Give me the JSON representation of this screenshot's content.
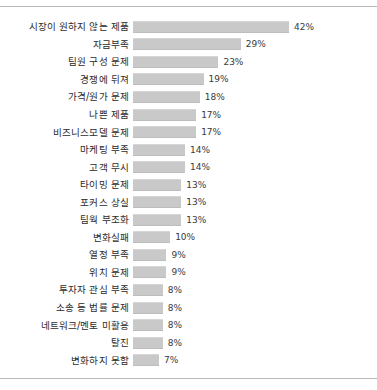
{
  "chart_data": {
    "type": "bar",
    "orientation": "horizontal",
    "title": "",
    "subtitle": "",
    "xlabel": "",
    "ylabel": "",
    "xlim": [
      0,
      42
    ],
    "grid": false,
    "legend": null,
    "value_suffix": "%",
    "bar_color": "#c9c9c9",
    "categories": [
      "시장이 원하지 않는 제품",
      "자금부족",
      "팀원 구성 문제",
      "경쟁에 뒤져",
      "가격/원가 문제",
      "나쁜 제품",
      "비즈니스모델 문제",
      "마케팅 부족",
      "고객 무시",
      "타이밍 문제",
      "포커스 상실",
      "팀웍 부조화",
      "변화실패",
      "열정 부족",
      "위치 문제",
      "투자자 관심 부족",
      "소송 등 법률 문제",
      "네트워크/멘토 미활용",
      "탈진",
      "변화하지 못함"
    ],
    "values": [
      42,
      29,
      23,
      19,
      18,
      17,
      17,
      14,
      14,
      13,
      13,
      13,
      10,
      9,
      9,
      8,
      8,
      8,
      8,
      7
    ],
    "value_labels": [
      "42%",
      "29%",
      "23%",
      "19%",
      "18%",
      "17%",
      "17%",
      "14%",
      "14%",
      "13%",
      "13%",
      "13%",
      "10%",
      "9%",
      "9%",
      "8%",
      "8%",
      "8%",
      "8%",
      "7%"
    ]
  }
}
